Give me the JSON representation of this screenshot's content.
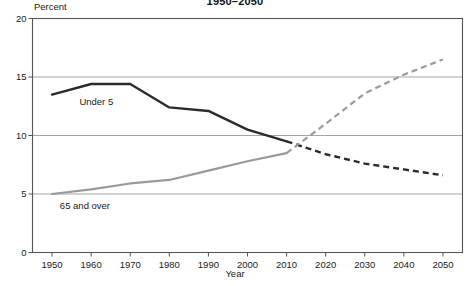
{
  "chart_data": {
    "type": "line",
    "title": "1950–2050",
    "xlabel": "Year",
    "ylabel": "Percent",
    "xlim": [
      1945,
      2055
    ],
    "ylim": [
      0,
      20
    ],
    "grid": "horizontal",
    "legend_position": "inline-annotations",
    "x_ticks": [
      1950,
      1960,
      1970,
      1980,
      1990,
      2000,
      2010,
      2020,
      2030,
      2040,
      2050
    ],
    "y_ticks": [
      0,
      5,
      10,
      15,
      20
    ],
    "series": [
      {
        "name": "Under 5",
        "color": "#2b2b2b",
        "label_x": 1957,
        "label_y": 12.9,
        "historical_end_year": 2010,
        "x": [
          1950,
          1960,
          1970,
          1980,
          1990,
          2000,
          2010,
          2020,
          2030,
          2040,
          2050
        ],
        "values": [
          13.5,
          14.4,
          14.4,
          12.4,
          12.1,
          10.5,
          9.5,
          8.4,
          7.6,
          7.1,
          6.6
        ]
      },
      {
        "name": "65 and over",
        "color": "#9a9a9a",
        "label_x": 1952,
        "label_y": 4.0,
        "historical_end_year": 2010,
        "x": [
          1950,
          1960,
          1970,
          1980,
          1990,
          2000,
          2010,
          2020,
          2030,
          2040,
          2050
        ],
        "values": [
          5.0,
          5.4,
          5.9,
          6.2,
          7.0,
          7.8,
          8.5,
          11.0,
          13.6,
          15.2,
          16.5
        ]
      }
    ]
  },
  "axes": {
    "y_tick_labels": [
      "0",
      "5",
      "10",
      "15",
      "20"
    ],
    "x_tick_labels": [
      "1950",
      "1960",
      "1970",
      "1980",
      "1990",
      "2000",
      "2010",
      "2020",
      "2030",
      "2040",
      "2050"
    ]
  },
  "colors": {
    "under5": "#2b2b2b",
    "over65": "#9a9a9a",
    "gridline": "#9b9b9b",
    "axis": "#555555",
    "background": "#ffffff"
  }
}
